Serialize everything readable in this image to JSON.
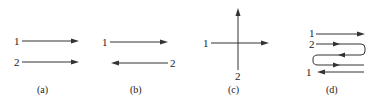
{
  "panels": [
    {
      "id": "a",
      "caption": "(a)",
      "stream1": "1",
      "stream2": "2",
      "type": "parallel-flow"
    },
    {
      "id": "b",
      "caption": "(b)",
      "stream1": "1",
      "stream2": "2",
      "type": "counter-flow"
    },
    {
      "id": "c",
      "caption": "(c)",
      "stream1": "1",
      "stream2": "2",
      "type": "cross-flow"
    },
    {
      "id": "d",
      "caption": "(d)",
      "stream1_in": "1",
      "stream2": "2",
      "stream1_out": "1",
      "type": "multi-pass-flow"
    }
  ],
  "colors": {
    "line": "#333333",
    "text": "#222222",
    "background": "#ffffff"
  }
}
